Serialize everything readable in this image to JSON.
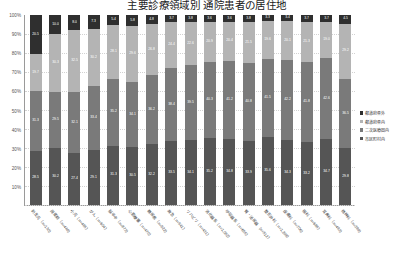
{
  "title": "主要診療領域別 通院患者の居住地",
  "legend": {
    "position": "right",
    "items": [
      {
        "label": "都道府県外",
        "color": "#2f2f2f"
      },
      {
        "label": "都道府県内",
        "color": "#b4b4b4"
      },
      {
        "label": "二次医療圏内",
        "color": "#7a7a7a"
      },
      {
        "label": "市区町村内",
        "color": "#555555"
      }
    ]
  },
  "chart_data": {
    "type": "bar",
    "subtype": "stacked-100-percent",
    "title": "主要診療領域別 通院患者の居住地",
    "xlabel": "",
    "ylabel": "",
    "ylim": [
      0,
      100
    ],
    "yticks": [
      "0%",
      "10%",
      "20%",
      "30%",
      "40%",
      "50%",
      "60%",
      "70%",
      "80%",
      "90%",
      "100%"
    ],
    "grid": true,
    "categories": [
      "新生児（n=130）",
      "周産期（n=448）",
      "小児（n=495）",
      "がん（n=604）",
      "脳卒中（n=873）",
      "心筋梗塞（n=470）",
      "糖尿病（n=522）",
      "救急（n=541）",
      "リハビリ（n=431）",
      "消化器系（n=1,052）",
      "呼吸器系（n=655）",
      "腎・泌尿器（n=512）",
      "整形外科（n=1,208）",
      "皮膚科（n=706）",
      "眼科（n=688）",
      "耳鼻科（n=493）",
      "精神科（n=389）"
    ],
    "series": [
      {
        "name": "市区町村内",
        "color": "#555555",
        "values": [
          28.5,
          30.2,
          27.4,
          29.1,
          31.3,
          30.5,
          32.2,
          33.5,
          34.1,
          35.2,
          34.8,
          33.9,
          35.6,
          34.3,
          33.2,
          34.7,
          29.8
        ]
      },
      {
        "name": "二次医療圏内",
        "color": "#7a7a7a",
        "values": [
          31.3,
          29.5,
          32.1,
          33.4,
          35.2,
          34.1,
          36.2,
          38.4,
          39.5,
          40.3,
          41.2,
          40.8,
          41.5,
          42.2,
          41.8,
          42.6,
          36.5
        ]
      },
      {
        "name": "都道府県内",
        "color": "#b4b4b4",
        "values": [
          19.7,
          30.3,
          32.5,
          30.2,
          28.1,
          29.6,
          26.8,
          24.4,
          22.6,
          20.9,
          20.4,
          21.5,
          19.6,
          20.1,
          21.3,
          19.0,
          29.2
        ]
      },
      {
        "name": "都道府県外",
        "color": "#2f2f2f",
        "values": [
          20.5,
          10.0,
          8.0,
          7.3,
          5.4,
          5.8,
          4.8,
          3.7,
          3.8,
          3.6,
          3.6,
          3.8,
          3.3,
          3.4,
          3.7,
          3.7,
          4.5
        ]
      }
    ],
    "bar_labels": [
      [
        "28.5",
        "31.3",
        "19.7",
        "20.5"
      ],
      [
        "30.2",
        "29.5",
        "30.3",
        "10.0"
      ],
      [
        "27.4",
        "32.1",
        "32.5",
        "8.0"
      ],
      [
        "29.1",
        "33.4",
        "30.2",
        "7.3"
      ],
      [
        "31.3",
        "35.2",
        "28.1",
        "5.4"
      ],
      [
        "30.5",
        "34.1",
        "29.6",
        "5.8"
      ],
      [
        "32.2",
        "36.2",
        "26.8",
        "4.8"
      ],
      [
        "33.5",
        "38.4",
        "24.4",
        "3.7"
      ],
      [
        "34.1",
        "39.5",
        "22.6",
        "3.8"
      ],
      [
        "35.2",
        "40.3",
        "20.9",
        "3.6"
      ],
      [
        "34.8",
        "41.2",
        "20.4",
        "3.6"
      ],
      [
        "33.9",
        "40.8",
        "21.5",
        "3.8"
      ],
      [
        "35.6",
        "41.5",
        "19.6",
        "3.3"
      ],
      [
        "34.3",
        "42.2",
        "20.1",
        "3.4"
      ],
      [
        "33.2",
        "41.8",
        "21.3",
        "3.7"
      ],
      [
        "34.7",
        "42.6",
        "19.0",
        "3.7"
      ],
      [
        "29.8",
        "36.5",
        "29.2",
        "4.5"
      ]
    ]
  }
}
